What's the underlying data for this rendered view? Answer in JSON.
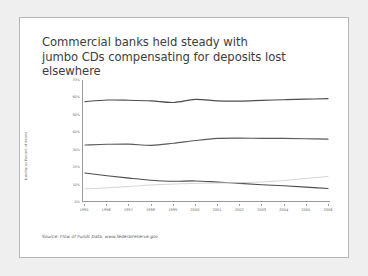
{
  "slide": {
    "title": "Commercial banks held steady with\njumbo CDs compensating for deposits lost\nelsewhere",
    "source": "Source: Flow of Funds Data, www.federalreserve.gov"
  },
  "chart_data": {
    "type": "line",
    "title": "",
    "xlabel": "",
    "ylabel": "Liability as Percent of Assets",
    "categories": [
      "1995",
      "1996",
      "1997",
      "1998",
      "1999",
      "2000",
      "2001",
      "2002",
      "2003",
      "2004",
      "2005",
      "2006"
    ],
    "x": [
      1995,
      1996,
      1997,
      1998,
      1999,
      2000,
      2001,
      2002,
      2003,
      2004,
      2005,
      2006
    ],
    "ylim": [
      0,
      70
    ],
    "xlim": [
      1995,
      2006
    ],
    "yticks": [
      0,
      10,
      20,
      30,
      40,
      50,
      60,
      70
    ],
    "ytick_labels": [
      "0%",
      "10%",
      "20%",
      "30%",
      "40%",
      "50%",
      "60%",
      "70%"
    ],
    "grid": false,
    "legend": "none",
    "series": [
      {
        "name": "Total deposits",
        "color": "#4d4d4d",
        "values": [
          57.5,
          58.4,
          58.3,
          57.9,
          57.0,
          58.8,
          57.9,
          57.8,
          58.2,
          58.6,
          58.9,
          59.2
        ]
      },
      {
        "name": "Core deposits",
        "color": "#5a5a5a",
        "values": [
          32.4,
          32.8,
          32.9,
          32.2,
          33.4,
          35.0,
          36.2,
          36.4,
          36.2,
          36.2,
          36.0,
          35.8
        ]
      },
      {
        "name": "Small time deposits",
        "color": "#4d4d4d",
        "values": [
          16.2,
          14.6,
          13.2,
          12.0,
          11.4,
          11.6,
          10.9,
          10.2,
          9.4,
          8.8,
          8.0,
          7.2
        ]
      },
      {
        "name": "Large time deposits (jumbo CDs)",
        "color": "#cfcfcf",
        "values": [
          7.0,
          7.6,
          8.4,
          9.3,
          9.8,
          10.2,
          10.4,
          10.6,
          11.0,
          11.8,
          13.0,
          14.2
        ]
      }
    ]
  }
}
